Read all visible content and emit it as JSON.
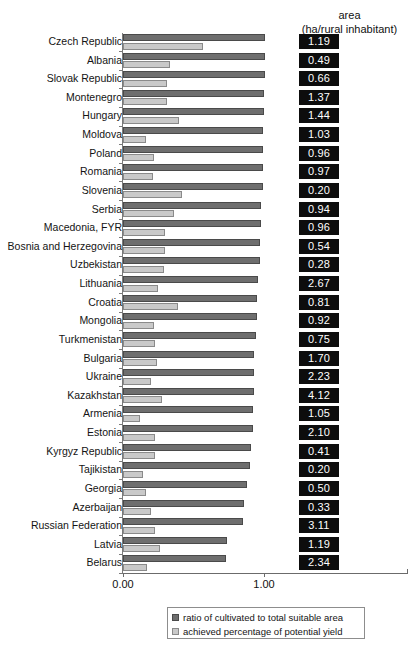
{
  "header": {
    "line1": "area",
    "line2": "(ha/rural inhabitant)"
  },
  "axis": {
    "tick_labels": [
      "0.00",
      "1.00"
    ],
    "tick_values": [
      0,
      1
    ]
  },
  "legend": {
    "items": [
      {
        "label": "ratio of cultivated to total suitable area",
        "color": "#6e6e6e"
      },
      {
        "label": "achieved percentage of potential yield",
        "color": "#c9c9c9"
      }
    ]
  },
  "chart_data": {
    "type": "bar",
    "orientation": "horizontal",
    "title": "",
    "xlabel": "",
    "ylabel": "",
    "xlim": [
      0,
      2.02
    ],
    "grid": false,
    "legend_position": "bottom",
    "value_column_header": "area (ha/rural inhabitant)",
    "categories": [
      "Czech Republic",
      "Albania",
      "Slovak Republic",
      "Montenegro",
      "Hungary",
      "Moldova",
      "Poland",
      "Romania",
      "Slovenia",
      "Serbia",
      "Macedonia, FYR",
      "Bosnia and Herzegovina",
      "Uzbekistan",
      "Lithuania",
      "Croatia",
      "Mongolia",
      "Turkmenistan",
      "Bulgaria",
      "Ukraine",
      "Kazakhstan",
      "Armenia",
      "Estonia",
      "Kyrgyz Republic",
      "Tajikistan",
      "Georgia",
      "Azerbaijan",
      "Russian Federation",
      "Latvia",
      "Belarus"
    ],
    "series": [
      {
        "name": "ratio of cultivated to total suitable area",
        "color": "#6e6e6e",
        "values": [
          1.01,
          1.01,
          1.01,
          1.0,
          1.0,
          0.99,
          0.99,
          0.99,
          0.99,
          0.98,
          0.98,
          0.97,
          0.97,
          0.96,
          0.95,
          0.95,
          0.94,
          0.93,
          0.93,
          0.93,
          0.92,
          0.92,
          0.91,
          0.9,
          0.88,
          0.86,
          0.85,
          0.74,
          0.73
        ]
      },
      {
        "name": "achieved percentage of potential yield",
        "color": "#c9c9c9",
        "values": [
          0.57,
          0.33,
          0.31,
          0.31,
          0.4,
          0.16,
          0.22,
          0.21,
          0.42,
          0.36,
          0.3,
          0.3,
          0.29,
          0.25,
          0.39,
          0.22,
          0.23,
          0.24,
          0.2,
          0.28,
          0.12,
          0.23,
          0.23,
          0.14,
          0.16,
          0.2,
          0.23,
          0.26,
          0.17
        ]
      }
    ],
    "value_labels": [
      "1.19",
      "0.49",
      "0.66",
      "1.37",
      "1.44",
      "1.03",
      "0.96",
      "0.97",
      "0.20",
      "0.94",
      "0.96",
      "0.54",
      "0.28",
      "2.67",
      "0.81",
      "0.92",
      "0.75",
      "1.70",
      "2.23",
      "4.12",
      "1.05",
      "2.10",
      "0.41",
      "0.20",
      "0.50",
      "0.33",
      "3.11",
      "1.19",
      "2.34"
    ]
  }
}
